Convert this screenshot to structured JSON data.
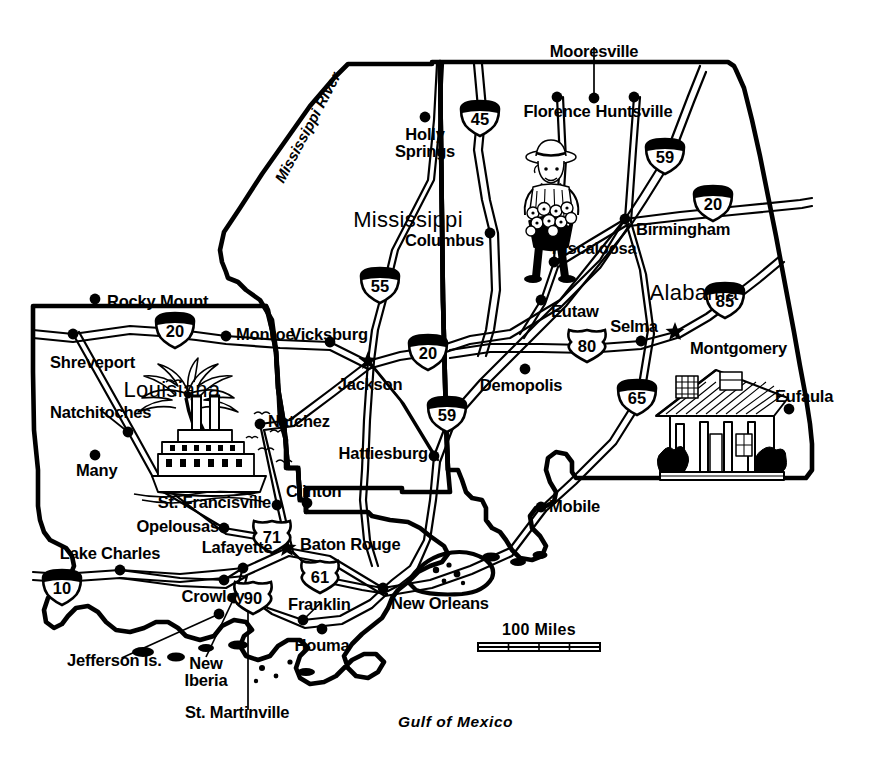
{
  "map": {
    "title": "Louisiana, Mississippi and Alabama road map",
    "background_color": "#ffffff",
    "ink_color": "#000000",
    "states": [
      {
        "name": "Louisiana",
        "x": 172,
        "y": 379,
        "capital": "Baton Rouge"
      },
      {
        "name": "Mississippi",
        "x": 408,
        "y": 209,
        "capital": "Jackson"
      },
      {
        "name": "Alabama",
        "x": 694,
        "y": 282,
        "capital": "Montgomery"
      }
    ],
    "water_labels": [
      {
        "name": "Gulf of Mexico",
        "x": 398,
        "y": 714
      },
      {
        "name": "Mississippi River",
        "x": 272,
        "y": 178,
        "rotation": -62
      }
    ],
    "cities": [
      {
        "name": "Mooresville",
        "dot_x": 594,
        "dot_y": 98,
        "label_x": 594,
        "label_y": 43,
        "align": "center",
        "capital": false,
        "leader": true
      },
      {
        "name": "Florence",
        "dot_x": 557,
        "dot_y": 97,
        "label_x": 557,
        "label_y": 103,
        "align": "center",
        "capital": false,
        "leader": false
      },
      {
        "name": "Huntsville",
        "dot_x": 634,
        "dot_y": 97,
        "label_x": 634,
        "label_y": 103,
        "align": "center",
        "capital": false,
        "leader": false
      },
      {
        "name": "Holly Springs",
        "dot_x": 425,
        "dot_y": 117,
        "label_x": 425,
        "label_y": 126,
        "align": "center",
        "capital": false,
        "leader": false,
        "lines": [
          "Holly",
          "Springs"
        ]
      },
      {
        "name": "Columbus",
        "dot_x": 490,
        "dot_y": 233,
        "label_x": 484,
        "label_y": 232,
        "align": "right",
        "capital": false,
        "leader": false
      },
      {
        "name": "Birmingham",
        "dot_x": 625,
        "dot_y": 219,
        "label_x": 636,
        "label_y": 221,
        "align": "left",
        "capital": false,
        "leader": false
      },
      {
        "name": "Tuscaloosa",
        "dot_x": 554,
        "dot_y": 262,
        "label_x": 549,
        "label_y": 240,
        "align": "left",
        "capital": false,
        "leader": false
      },
      {
        "name": "Rocky Mount",
        "dot_x": 95,
        "dot_y": 299,
        "label_x": 107,
        "label_y": 293,
        "align": "left",
        "capital": false,
        "leader": false
      },
      {
        "name": "Eutaw",
        "dot_x": 541,
        "dot_y": 300,
        "label_x": 551,
        "label_y": 303,
        "align": "left",
        "capital": false,
        "leader": false
      },
      {
        "name": "Selma",
        "dot_x": 641,
        "dot_y": 341,
        "label_x": 634,
        "label_y": 318,
        "align": "center",
        "capital": false,
        "leader": false
      },
      {
        "name": "Monroe",
        "dot_x": 226,
        "dot_y": 336,
        "label_x": 236,
        "label_y": 326,
        "align": "left",
        "capital": false,
        "leader": false
      },
      {
        "name": "Vicksburg",
        "dot_x": 330,
        "dot_y": 342,
        "label_x": 329,
        "label_y": 326,
        "align": "center",
        "capital": false,
        "leader": false
      },
      {
        "name": "Shreveport",
        "dot_x": 73,
        "dot_y": 334,
        "label_x": 50,
        "label_y": 354,
        "align": "left",
        "capital": false,
        "leader": false
      },
      {
        "name": "Montgomery",
        "dot_x": 675,
        "dot_y": 332,
        "label_x": 690,
        "label_y": 340,
        "align": "left",
        "capital": true,
        "leader": false
      },
      {
        "name": "Jackson",
        "dot_x": 368,
        "dot_y": 361,
        "label_x": 370,
        "label_y": 376,
        "align": "center",
        "capital": true,
        "leader": false
      },
      {
        "name": "Demopolis",
        "dot_x": 525,
        "dot_y": 369,
        "label_x": 521,
        "label_y": 377,
        "align": "center",
        "capital": false,
        "leader": false
      },
      {
        "name": "Natchitoches",
        "dot_x": 128,
        "dot_y": 432,
        "label_x": 50,
        "label_y": 404,
        "align": "left",
        "capital": false,
        "leader": true
      },
      {
        "name": "Natchez",
        "dot_x": 260,
        "dot_y": 424,
        "label_x": 268,
        "label_y": 413,
        "align": "left",
        "capital": false,
        "leader": false
      },
      {
        "name": "Eufaula",
        "dot_x": 789,
        "dot_y": 409,
        "label_x": 775,
        "label_y": 388,
        "align": "left",
        "capital": false,
        "leader": false
      },
      {
        "name": "Hattiesburg",
        "dot_x": 434,
        "dot_y": 456,
        "label_x": 428,
        "label_y": 445,
        "align": "right",
        "capital": false,
        "leader": false
      },
      {
        "name": "Many",
        "dot_x": 95,
        "dot_y": 455,
        "label_x": 76,
        "label_y": 462,
        "align": "left",
        "capital": false,
        "leader": false
      },
      {
        "name": "Mobile",
        "dot_x": 541,
        "dot_y": 507,
        "label_x": 549,
        "label_y": 498,
        "align": "left",
        "capital": false,
        "leader": false
      },
      {
        "name": "Clinton",
        "dot_x": 307,
        "dot_y": 503,
        "label_x": 286,
        "label_y": 483,
        "align": "left",
        "capital": false,
        "leader": false
      },
      {
        "name": "St. Francisville",
        "dot_x": 277,
        "dot_y": 505,
        "label_x": 271,
        "label_y": 494,
        "align": "right",
        "capital": false,
        "leader": false
      },
      {
        "name": "Opelousas",
        "dot_x": 224,
        "dot_y": 528,
        "label_x": 219,
        "label_y": 518,
        "align": "right",
        "capital": false,
        "leader": false
      },
      {
        "name": "Baton Rouge",
        "dot_x": 287,
        "dot_y": 548,
        "label_x": 300,
        "label_y": 536,
        "align": "left",
        "capital": true,
        "leader": false
      },
      {
        "name": "Lafayette",
        "dot_x": 243,
        "dot_y": 568,
        "label_x": 237,
        "label_y": 539,
        "align": "center",
        "capital": false,
        "leader": false
      },
      {
        "name": "Lake Charles",
        "dot_x": 120,
        "dot_y": 570,
        "label_x": 110,
        "label_y": 545,
        "align": "center",
        "capital": false,
        "leader": false
      },
      {
        "name": "Crowley",
        "dot_x": 224,
        "dot_y": 580,
        "label_x": 213,
        "label_y": 588,
        "align": "center",
        "capital": false,
        "leader": false
      },
      {
        "name": "New Orleans",
        "dot_x": 383,
        "dot_y": 588,
        "label_x": 391,
        "label_y": 595,
        "align": "left",
        "capital": false,
        "leader": false
      },
      {
        "name": "Franklin",
        "dot_x": 303,
        "dot_y": 620,
        "label_x": 288,
        "label_y": 596,
        "align": "left",
        "capital": false,
        "leader": true
      },
      {
        "name": "Houma",
        "dot_x": 322,
        "dot_y": 629,
        "label_x": 322,
        "label_y": 637,
        "align": "center",
        "capital": false,
        "leader": false
      },
      {
        "name": "New Iberia",
        "dot_x": 234,
        "dot_y": 598,
        "label_x": 206,
        "label_y": 655,
        "align": "center",
        "capital": false,
        "leader": true,
        "lines": [
          "New",
          "Iberia"
        ]
      },
      {
        "name": "Jefferson Is.",
        "dot_x": 219,
        "dot_y": 614,
        "label_x": 67,
        "label_y": 652,
        "align": "left",
        "capital": false,
        "leader": true
      },
      {
        "name": "St. Martinville",
        "dot_x": 248,
        "dot_y": 591,
        "label_x": 185,
        "label_y": 704,
        "align": "left",
        "capital": false,
        "leader": true
      }
    ],
    "highway_shields": [
      {
        "number": "45",
        "type": "interstate",
        "x": 480,
        "y": 118
      },
      {
        "number": "59",
        "type": "interstate",
        "x": 665,
        "y": 156
      },
      {
        "number": "20",
        "type": "interstate",
        "x": 713,
        "y": 203
      },
      {
        "number": "55",
        "type": "interstate",
        "x": 380,
        "y": 285
      },
      {
        "number": "20",
        "type": "interstate",
        "x": 175,
        "y": 330
      },
      {
        "number": "20",
        "type": "interstate",
        "x": 428,
        "y": 352
      },
      {
        "number": "85",
        "type": "interstate",
        "x": 725,
        "y": 300
      },
      {
        "number": "80",
        "type": "us",
        "x": 587,
        "y": 345
      },
      {
        "number": "59",
        "type": "interstate",
        "x": 447,
        "y": 414
      },
      {
        "number": "65",
        "type": "interstate",
        "x": 637,
        "y": 397
      },
      {
        "number": "71",
        "type": "us",
        "x": 272,
        "y": 536
      },
      {
        "number": "61",
        "type": "us",
        "x": 320,
        "y": 576
      },
      {
        "number": "10",
        "type": "interstate",
        "x": 62,
        "y": 587
      },
      {
        "number": "90",
        "type": "us",
        "x": 253,
        "y": 597
      }
    ],
    "illustrations": [
      {
        "name": "flower-vendor",
        "x": 551,
        "y": 215,
        "caption": "flower vendor with straw hat and basket of flowers"
      },
      {
        "name": "riverboat-and-palm",
        "x": 188,
        "y": 440,
        "caption": "palm tree, steamboat and seagulls"
      },
      {
        "name": "antebellum-house",
        "x": 722,
        "y": 420,
        "caption": "antebellum plantation house with columns"
      }
    ],
    "scale_bar": {
      "label": "100 Miles",
      "label_x": 539,
      "label_y": 622,
      "bar_x": 478,
      "bar_y": 643,
      "bar_width": 122,
      "ticks": 3
    }
  }
}
